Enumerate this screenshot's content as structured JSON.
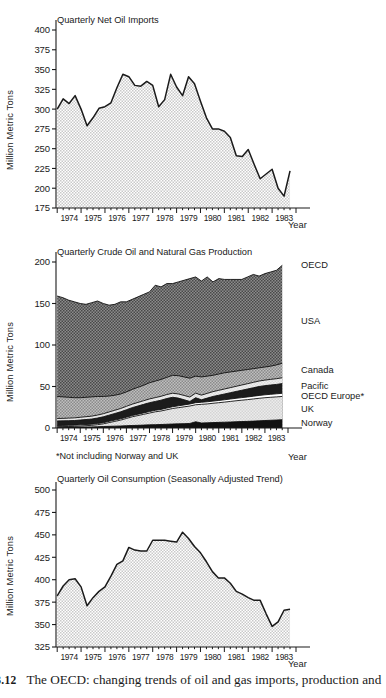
{
  "figure": {
    "caption_fragment": "e",
    "caption_number": "3.12",
    "caption_text": "The OECD: changing trends of oil and gas imports, production and"
  },
  "chart_data": [
    {
      "type": "area",
      "title": "Quarterly Net Oil Imports",
      "xlabel": "Year",
      "ylabel": "Million Metric Tons",
      "ylim": [
        175,
        400
      ],
      "yticks": [
        175,
        200,
        225,
        250,
        275,
        300,
        325,
        350,
        375,
        400
      ],
      "categories": [
        "1974",
        "1975",
        "1976",
        "1977",
        "1978",
        "1979",
        "1980",
        "1981",
        "1982",
        "1983"
      ],
      "grid": false,
      "legend": "none",
      "x": [
        1974.0,
        1974.25,
        1974.5,
        1974.75,
        1975.0,
        1975.25,
        1975.5,
        1975.75,
        1976.0,
        1976.25,
        1976.5,
        1976.75,
        1977.0,
        1977.25,
        1977.5,
        1977.75,
        1978.0,
        1978.25,
        1978.5,
        1978.75,
        1979.0,
        1979.25,
        1979.5,
        1979.75,
        1980.0,
        1980.25,
        1980.5,
        1980.75,
        1981.0,
        1981.25,
        1981.5,
        1981.75,
        1982.0,
        1982.25,
        1982.5,
        1982.75,
        1983.0,
        1983.25,
        1983.5,
        1983.75
      ],
      "values": [
        300,
        313,
        307,
        317,
        300,
        279,
        289,
        301,
        303,
        308,
        327,
        344,
        341,
        330,
        329,
        335,
        330,
        303,
        312,
        344,
        328,
        317,
        341,
        332,
        310,
        289,
        275,
        275,
        272,
        264,
        241,
        240,
        249,
        230,
        212,
        218,
        224,
        200,
        190,
        222
      ]
    },
    {
      "type": "area",
      "stacked": true,
      "title": "Quarterly Crude Oil and Natural Gas Production",
      "xlabel": "Year",
      "ylabel": "Million Metric Tons",
      "ylim": [
        0,
        200
      ],
      "yticks": [
        0,
        50,
        100,
        150,
        200
      ],
      "categories": [
        "1974",
        "1975",
        "1976",
        "1977",
        "1978",
        "1979",
        "1980",
        "1981",
        "1982",
        "1983"
      ],
      "grid": false,
      "legend": "right",
      "footnote": "*Not including Norway and UK",
      "x": [
        1974.0,
        1974.25,
        1974.5,
        1974.75,
        1975.0,
        1975.25,
        1975.5,
        1975.75,
        1976.0,
        1976.25,
        1976.5,
        1976.75,
        1977.0,
        1977.25,
        1977.5,
        1977.75,
        1978.0,
        1978.25,
        1978.5,
        1978.75,
        1979.0,
        1979.25,
        1979.5,
        1979.75,
        1980.0,
        1980.25,
        1980.5,
        1980.75,
        1981.0,
        1981.25,
        1981.5,
        1981.75,
        1982.0,
        1982.25,
        1982.5,
        1982.75,
        1983.0,
        1983.25,
        1983.5,
        1983.75
      ],
      "series": [
        {
          "name": "Norway",
          "label": "Norway",
          "color": "#111111",
          "pattern": "solid-dark",
          "cumulative_top": [
            1.0,
            1.0,
            1.1,
            1.1,
            1.2,
            1.2,
            1.3,
            1.5,
            1.8,
            2.0,
            2.2,
            2.4,
            2.8,
            3.0,
            3.2,
            3.5,
            3.8,
            4.0,
            4.2,
            4.5,
            4.8,
            5.0,
            5.2,
            5.5,
            7.5,
            6.0,
            6.2,
            6.5,
            6.8,
            7.0,
            7.2,
            7.5,
            7.8,
            8.0,
            8.3,
            8.6,
            9.0,
            9.3,
            9.6,
            10.0
          ]
        },
        {
          "name": "UK",
          "label": "UK",
          "color": "#e8e8e8",
          "pattern": "light",
          "cumulative_top": [
            1.6,
            1.7,
            1.8,
            2.0,
            2.4,
            2.8,
            3.2,
            4.0,
            5.0,
            6.5,
            8.0,
            9.5,
            11.5,
            13.5,
            15.0,
            16.5,
            18.0,
            19.5,
            20.5,
            22.0,
            23.5,
            24.5,
            25.5,
            26.5,
            28.0,
            28.5,
            29.0,
            29.8,
            30.5,
            31.2,
            32.0,
            32.8,
            33.5,
            34.2,
            35.0,
            35.8,
            36.5,
            37.0,
            37.5,
            38.0
          ]
        },
        {
          "name": "OECD Europe*",
          "label": "OECD Europe*",
          "color": "#ffffff",
          "pattern": "white",
          "cumulative_top": [
            3.0,
            3.1,
            3.2,
            3.4,
            3.8,
            4.2,
            4.6,
            5.4,
            6.4,
            8.0,
            9.5,
            11.0,
            13.0,
            15.0,
            16.6,
            18.2,
            19.8,
            21.3,
            22.4,
            24.0,
            25.6,
            26.7,
            27.8,
            28.9,
            30.5,
            31.0,
            31.6,
            32.4,
            33.2,
            34.0,
            34.9,
            35.8,
            36.6,
            37.4,
            38.3,
            39.2,
            40.0,
            40.6,
            41.2,
            41.8
          ]
        },
        {
          "name": "Pacific",
          "label": "Pacific",
          "color": "#1c1c1c",
          "pattern": "dark",
          "cumulative_top": [
            8.5,
            8.6,
            8.8,
            9.0,
            9.6,
            10.2,
            10.8,
            12.0,
            13.5,
            15.5,
            17.5,
            19.5,
            22.0,
            24.5,
            26.5,
            28.5,
            30.5,
            32.0,
            33.5,
            35.5,
            37.0,
            36.0,
            34.0,
            32.0,
            36.5,
            34.0,
            36.0,
            38.0,
            39.5,
            41.0,
            42.5,
            44.0,
            45.5,
            47.0,
            48.5,
            50.0,
            51.0,
            51.8,
            52.5,
            53.5
          ]
        },
        {
          "name": "Canada",
          "label": "Canada",
          "color": "#ededed",
          "pattern": "verylight",
          "cumulative_top": [
            11.5,
            11.6,
            11.9,
            12.2,
            12.9,
            13.6,
            14.3,
            15.6,
            17.2,
            19.3,
            21.4,
            23.5,
            26.1,
            28.7,
            30.8,
            32.9,
            35.0,
            36.6,
            38.2,
            40.3,
            41.9,
            41.0,
            39.2,
            37.3,
            42.0,
            39.6,
            41.7,
            43.8,
            45.4,
            47.0,
            48.6,
            50.2,
            51.8,
            53.4,
            55.0,
            56.6,
            57.7,
            58.6,
            59.4,
            60.5
          ]
        },
        {
          "name": "USA",
          "label": "USA",
          "color": "#999999",
          "pattern": "mid",
          "cumulative_top": [
            38.0,
            37.5,
            37.0,
            36.5,
            36.5,
            37.0,
            37.5,
            38.0,
            38.0,
            38.5,
            39.5,
            41.0,
            43.5,
            46.5,
            49.0,
            51.5,
            54.5,
            56.5,
            58.5,
            61.0,
            63.5,
            63.0,
            61.5,
            60.0,
            62.5,
            61.5,
            62.5,
            63.5,
            65.0,
            66.5,
            67.5,
            68.5,
            69.5,
            70.5,
            71.5,
            72.5,
            73.5,
            74.5,
            76.0,
            78.0
          ]
        },
        {
          "name": "OECD",
          "label": "OECD",
          "color": "#6e6e6e",
          "pattern": "darkhatch",
          "cumulative_top": [
            159,
            157,
            154,
            152,
            150,
            149,
            151,
            153,
            150,
            148,
            149,
            152,
            152,
            155,
            158,
            161,
            164,
            172,
            170,
            174,
            174,
            176,
            178,
            180,
            182,
            177,
            182,
            176,
            180,
            179,
            179,
            179,
            179,
            182,
            185,
            183,
            186,
            188,
            190,
            196
          ]
        }
      ]
    },
    {
      "type": "area",
      "title": "Quarterly Oil Consumption (Seasonally Adjusted Trend)",
      "xlabel": "Year",
      "ylabel": "Million Metric Tons",
      "ylim": [
        325,
        500
      ],
      "yticks": [
        325,
        350,
        375,
        400,
        425,
        450,
        475,
        500
      ],
      "categories": [
        "1974",
        "1975",
        "1976",
        "1977",
        "1978",
        "1979",
        "1980",
        "1981",
        "1982",
        "1983"
      ],
      "grid": false,
      "legend": "none",
      "x": [
        1974.0,
        1974.25,
        1974.5,
        1974.75,
        1975.0,
        1975.25,
        1975.5,
        1975.75,
        1976.0,
        1976.25,
        1976.5,
        1976.75,
        1977.0,
        1977.25,
        1977.5,
        1977.75,
        1978.0,
        1978.25,
        1978.5,
        1978.75,
        1979.0,
        1979.25,
        1979.5,
        1979.75,
        1980.0,
        1980.25,
        1980.5,
        1980.75,
        1981.0,
        1981.25,
        1981.5,
        1981.75,
        1982.0,
        1982.25,
        1982.5,
        1982.75,
        1983.0,
        1983.25,
        1983.5,
        1983.75
      ],
      "values": [
        382,
        393,
        400,
        401,
        392,
        371,
        380,
        387,
        392,
        404,
        417,
        421,
        436,
        433,
        432,
        432,
        444,
        444,
        444,
        443,
        442,
        453,
        446,
        437,
        430,
        420,
        409,
        402,
        402,
        396,
        387,
        384,
        380,
        377,
        377,
        362,
        348,
        353,
        366,
        367
      ]
    }
  ]
}
